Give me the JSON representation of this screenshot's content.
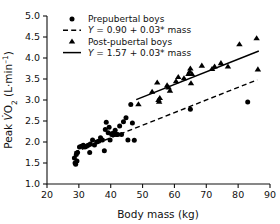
{
  "chart_data": {
    "type": "scatter",
    "title": "",
    "xlabel": "Body mass (kg)",
    "ylabel": "Peak V̇O₂ (L·min⁻¹)",
    "ylabel_parts": {
      "prefix": "Peak ",
      "v_symbol": "V̇",
      "o2": "O",
      "o2_sub": "2",
      "units": " (L·min",
      "units_sup": "–1",
      "units_close": ")"
    },
    "xlim": [
      20,
      90
    ],
    "ylim": [
      1.0,
      5.0
    ],
    "xticks": [
      20,
      30,
      40,
      50,
      60,
      70,
      80,
      90
    ],
    "yticks": [
      "1.0",
      "1.5",
      "2.0",
      "2.5",
      "3.0",
      "3.5",
      "4.0",
      "4.5",
      "5.0"
    ],
    "grid": false,
    "legend_position": "top-left",
    "marker_color": "#000000",
    "axis_color": "#111111",
    "legend": [
      {
        "label": "Prepubertal boys",
        "marker": "circle",
        "style": "marker"
      },
      {
        "label": "Y = 0.90 + 0.03* mass",
        "marker": "dashed-line",
        "style": "line",
        "italic_prefix": "Y"
      },
      {
        "label": "Post-pubertal boys",
        "marker": "triangle",
        "style": "marker"
      },
      {
        "label": "Y = 1.57 + 0.03* mass",
        "marker": "solid-line",
        "style": "line",
        "italic_prefix": "Y"
      }
    ],
    "series": [
      {
        "name": "Prepubertal boys",
        "marker": "circle",
        "points": [
          [
            28.6,
            1.62
          ],
          [
            28.8,
            1.5
          ],
          [
            29.0,
            1.47
          ],
          [
            29.2,
            1.7
          ],
          [
            29.4,
            1.55
          ],
          [
            29.6,
            1.75
          ],
          [
            30.2,
            1.88
          ],
          [
            30.8,
            1.9
          ],
          [
            31.4,
            1.92
          ],
          [
            31.9,
            1.88
          ],
          [
            32.4,
            1.9
          ],
          [
            32.9,
            1.92
          ],
          [
            33.4,
            1.75
          ],
          [
            33.6,
            1.95
          ],
          [
            34.3,
            2.05
          ],
          [
            34.9,
            1.93
          ],
          [
            35.6,
            2.0
          ],
          [
            36.2,
            2.02
          ],
          [
            36.8,
            2.1
          ],
          [
            37.4,
            2.05
          ],
          [
            38.0,
            1.79
          ],
          [
            38.3,
            2.3
          ],
          [
            38.6,
            2.47
          ],
          [
            39.2,
            2.22
          ],
          [
            39.5,
            2.35
          ],
          [
            39.8,
            2.05
          ],
          [
            40.3,
            2.18
          ],
          [
            40.5,
            2.2
          ],
          [
            40.8,
            2.17
          ],
          [
            41.0,
            2.2
          ],
          [
            41.4,
            2.28
          ],
          [
            41.8,
            2.18
          ],
          [
            42.2,
            2.18
          ],
          [
            42.8,
            2.38
          ],
          [
            43.4,
            2.18
          ],
          [
            44.0,
            2.48
          ],
          [
            44.8,
            2.58
          ],
          [
            45.4,
            2.05
          ],
          [
            46.3,
            2.89
          ],
          [
            46.8,
            2.45
          ],
          [
            47.4,
            2.04
          ],
          [
            65.0,
            2.78
          ],
          [
            83.0,
            2.95
          ]
        ]
      },
      {
        "name": "Post-pubertal boys",
        "marker": "triangle",
        "points": [
          [
            48.7,
            2.9
          ],
          [
            53.0,
            3.2
          ],
          [
            54.6,
            3.42
          ],
          [
            55.0,
            3.0
          ],
          [
            55.2,
            2.96
          ],
          [
            55.4,
            3.05
          ],
          [
            57.7,
            3.35
          ],
          [
            58.2,
            3.3
          ],
          [
            58.6,
            3.22
          ],
          [
            60.5,
            3.45
          ],
          [
            61.2,
            3.55
          ],
          [
            63.0,
            3.52
          ],
          [
            64.4,
            3.62
          ],
          [
            64.8,
            3.68
          ],
          [
            65.0,
            3.75
          ],
          [
            65.2,
            3.4
          ],
          [
            65.5,
            3.62
          ],
          [
            68.6,
            3.82
          ],
          [
            71.8,
            3.74
          ],
          [
            72.6,
            3.8
          ],
          [
            74.6,
            3.88
          ],
          [
            76.8,
            3.8
          ],
          [
            80.4,
            4.33
          ],
          [
            85.8,
            4.47
          ],
          [
            86.2,
            3.73
          ]
        ]
      }
    ],
    "fits": [
      {
        "name": "Prepubertal boys fit",
        "style": "dashed",
        "intercept": 0.9,
        "slope": 0.03,
        "x_start": 28.5,
        "x_end": 86.0,
        "equation": "Y = 0.90 + 0.03* mass"
      },
      {
        "name": "Post-pubertal boys fit",
        "style": "solid",
        "intercept": 1.57,
        "slope": 0.03,
        "x_start": 48.0,
        "x_end": 86.5,
        "equation": "Y = 1.57 + 0.03* mass"
      }
    ]
  }
}
